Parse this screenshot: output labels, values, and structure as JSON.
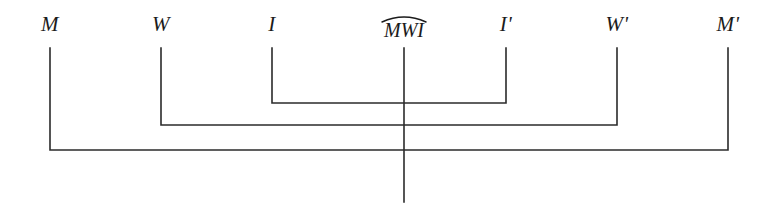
{
  "figure": {
    "type": "chiastic-structure-diagram",
    "background_color": "#ffffff",
    "line_color": "#2b2b2b",
    "text_color": "#1b1b1b",
    "width": 776,
    "height": 210
  },
  "labels": [
    {
      "id": "m",
      "text": "M",
      "x": 50,
      "y": 14,
      "has_prime": false,
      "has_arc": false
    },
    {
      "id": "w",
      "text": "W",
      "x": 161,
      "y": 14,
      "has_prime": false,
      "has_arc": false
    },
    {
      "id": "i",
      "text": "I",
      "x": 272,
      "y": 14,
      "has_prime": false,
      "has_arc": false
    },
    {
      "id": "mwi",
      "text": "MWI",
      "x": 404,
      "y": 14,
      "has_prime": false,
      "has_arc": true
    },
    {
      "id": "i-prime",
      "text": "Iʹ",
      "x": 506,
      "y": 14,
      "has_prime": true,
      "has_arc": false
    },
    {
      "id": "w-prime",
      "text": "Wʹ",
      "x": 617,
      "y": 14,
      "has_prime": true,
      "has_arc": false
    },
    {
      "id": "m-prime",
      "text": "Mʹ",
      "x": 728,
      "y": 14,
      "has_prime": true,
      "has_arc": false
    }
  ],
  "brackets": [
    {
      "id": "inner-bracket",
      "pairs": "I – Iʹ",
      "left_x": 272,
      "right_x": 506,
      "top_y": 48,
      "bottom_y": 103
    },
    {
      "id": "middle-bracket",
      "pairs": "W – Wʹ",
      "left_x": 161,
      "right_x": 617,
      "top_y": 48,
      "bottom_y": 125
    },
    {
      "id": "outer-bracket",
      "pairs": "M – Mʹ",
      "left_x": 50,
      "right_x": 728,
      "top_y": 48,
      "bottom_y": 150
    }
  ],
  "center_axis": {
    "id": "center-axis-line",
    "label": "MWI",
    "x": 404,
    "top_y": 48,
    "bottom_y": 202
  }
}
